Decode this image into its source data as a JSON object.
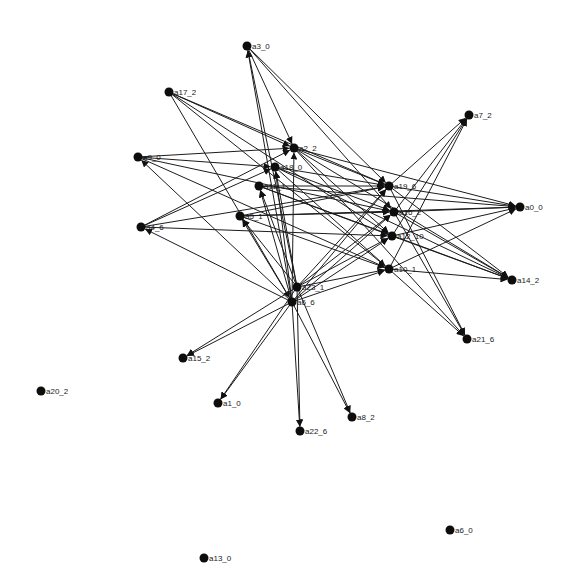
{
  "graph": {
    "title": "",
    "directed": true,
    "colors": {
      "background": "#ffffff",
      "node": "#0d0d0d",
      "edge": "#1c1c1c",
      "label": "#1a1a1a"
    },
    "nodes": [
      {
        "id": "a3_0",
        "label": "a3_0",
        "x": 247,
        "y": 46
      },
      {
        "id": "a17_2",
        "label": "a17_2",
        "x": 169,
        "y": 92
      },
      {
        "id": "a2_2",
        "label": "a2_2",
        "x": 294,
        "y": 148
      },
      {
        "id": "a18_0",
        "label": "a18_0",
        "x": 275,
        "y": 167
      },
      {
        "id": "a9_0",
        "label": "a9_0",
        "x": 138,
        "y": 157
      },
      {
        "id": "a11_1",
        "label": "a11_1",
        "x": 259,
        "y": 186
      },
      {
        "id": "a4_6",
        "label": "a4_6",
        "x": 141,
        "y": 227
      },
      {
        "id": "a5_1",
        "label": "a5_1",
        "x": 240,
        "y": 216
      },
      {
        "id": "a7_2",
        "label": "a7_2",
        "x": 469,
        "y": 115
      },
      {
        "id": "a19_6",
        "label": "a19_6",
        "x": 389,
        "y": 186
      },
      {
        "id": "a16_2",
        "label": "a16_2",
        "x": 394,
        "y": 212
      },
      {
        "id": "a12_10",
        "label": "a12_10",
        "x": 392,
        "y": 236
      },
      {
        "id": "a10_1",
        "label": "a10_1",
        "x": 389,
        "y": 269
      },
      {
        "id": "a0_0",
        "label": "a0_0",
        "x": 520,
        "y": 207
      },
      {
        "id": "a14_2",
        "label": "a14_2",
        "x": 512,
        "y": 280
      },
      {
        "id": "a21_6",
        "label": "a21_6",
        "x": 467,
        "y": 339
      },
      {
        "id": "a23_1",
        "label": "a23_1",
        "x": 297,
        "y": 287
      },
      {
        "id": "a6_6",
        "label": "a6_6",
        "x": 292,
        "y": 302
      },
      {
        "id": "a15_2",
        "label": "a15_2",
        "x": 183,
        "y": 358
      },
      {
        "id": "a1_0",
        "label": "a1_0",
        "x": 218,
        "y": 403
      },
      {
        "id": "a22_6",
        "label": "a22_6",
        "x": 300,
        "y": 431
      },
      {
        "id": "a8_2",
        "label": "a8_2",
        "x": 352,
        "y": 417
      },
      {
        "id": "a20_2",
        "label": "a20_2",
        "x": 41,
        "y": 391
      },
      {
        "id": "a6_0",
        "label": "a6_0",
        "x": 450,
        "y": 530
      },
      {
        "id": "a13_0",
        "label": "a13_0",
        "x": 204,
        "y": 558
      }
    ],
    "edges": [
      [
        "a6_6",
        "a3_0"
      ],
      [
        "a23_1",
        "a3_0"
      ],
      [
        "a3_0",
        "a2_2"
      ],
      [
        "a3_0",
        "a19_6"
      ],
      [
        "a3_0",
        "a16_2"
      ],
      [
        "a17_2",
        "a2_2"
      ],
      [
        "a17_2",
        "a19_6"
      ],
      [
        "a17_2",
        "a12_10"
      ],
      [
        "a17_2",
        "a6_6"
      ],
      [
        "a17_2",
        "a10_1"
      ],
      [
        "a9_0",
        "a2_2"
      ],
      [
        "a9_0",
        "a18_0"
      ],
      [
        "a9_0",
        "a16_2"
      ],
      [
        "a9_0",
        "a10_1"
      ],
      [
        "a6_6",
        "a9_0"
      ],
      [
        "a4_6",
        "a2_2"
      ],
      [
        "a4_6",
        "a18_0"
      ],
      [
        "a4_6",
        "a19_6"
      ],
      [
        "a6_6",
        "a4_6"
      ],
      [
        "a4_6",
        "a12_10"
      ],
      [
        "a5_1",
        "a19_6"
      ],
      [
        "a5_1",
        "a16_2"
      ],
      [
        "a5_1",
        "a0_0"
      ],
      [
        "a5_1",
        "a10_1"
      ],
      [
        "a11_1",
        "a19_6"
      ],
      [
        "a11_1",
        "a12_10"
      ],
      [
        "a11_1",
        "a14_2"
      ],
      [
        "a11_1",
        "a0_0"
      ],
      [
        "a18_0",
        "a19_6"
      ],
      [
        "a18_0",
        "a16_2"
      ],
      [
        "a18_0",
        "a14_2"
      ],
      [
        "a18_0",
        "a21_6"
      ],
      [
        "a2_2",
        "a19_6"
      ],
      [
        "a2_2",
        "a12_10"
      ],
      [
        "a2_2",
        "a0_0"
      ],
      [
        "a2_2",
        "a14_2"
      ],
      [
        "a2_2",
        "a21_6"
      ],
      [
        "a6_6",
        "a2_2"
      ],
      [
        "a6_6",
        "a18_0"
      ],
      [
        "a6_6",
        "a11_1"
      ],
      [
        "a6_6",
        "a5_1"
      ],
      [
        "a23_1",
        "a18_0"
      ],
      [
        "a23_1",
        "a11_1"
      ],
      [
        "a23_1",
        "a5_1"
      ],
      [
        "a6_6",
        "a19_6"
      ],
      [
        "a6_6",
        "a16_2"
      ],
      [
        "a6_6",
        "a12_10"
      ],
      [
        "a6_6",
        "a10_1"
      ],
      [
        "a23_1",
        "a19_6"
      ],
      [
        "a23_1",
        "a16_2"
      ],
      [
        "a23_1",
        "a12_10"
      ],
      [
        "a23_1",
        "a10_1"
      ],
      [
        "a19_6",
        "a7_2"
      ],
      [
        "a16_2",
        "a7_2"
      ],
      [
        "a12_10",
        "a7_2"
      ],
      [
        "a10_1",
        "a7_2"
      ],
      [
        "a19_6",
        "a0_0"
      ],
      [
        "a16_2",
        "a0_0"
      ],
      [
        "a12_10",
        "a0_0"
      ],
      [
        "a10_1",
        "a0_0"
      ],
      [
        "a19_6",
        "a14_2"
      ],
      [
        "a16_2",
        "a14_2"
      ],
      [
        "a12_10",
        "a14_2"
      ],
      [
        "a10_1",
        "a14_2"
      ],
      [
        "a19_6",
        "a21_6"
      ],
      [
        "a16_2",
        "a21_6"
      ],
      [
        "a6_6",
        "a15_2"
      ],
      [
        "a23_1",
        "a15_2"
      ],
      [
        "a6_6",
        "a1_0"
      ],
      [
        "a23_1",
        "a1_0"
      ],
      [
        "a6_6",
        "a22_6"
      ],
      [
        "a23_1",
        "a22_6"
      ],
      [
        "a6_6",
        "a8_2"
      ],
      [
        "a23_1",
        "a8_2"
      ]
    ]
  }
}
